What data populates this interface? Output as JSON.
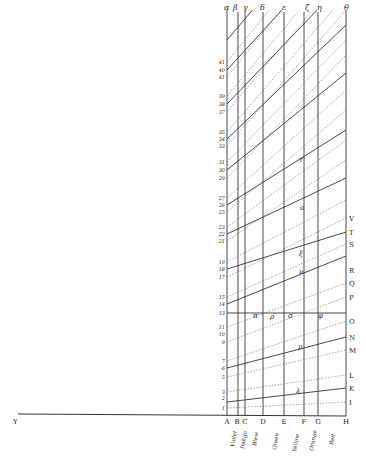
{
  "figure": {
    "baseline_left_label": "Y",
    "baseline_points": [
      {
        "label": "A",
        "x": 227
      },
      {
        "label": "B",
        "x": 238
      },
      {
        "label": "C",
        "x": 245
      },
      {
        "label": "D",
        "x": 263
      },
      {
        "label": "E",
        "x": 284
      },
      {
        "label": "F",
        "x": 304
      },
      {
        "label": "G",
        "x": 318
      },
      {
        "label": "H",
        "x": 346
      }
    ],
    "top_labels": [
      {
        "label": "α",
        "x": 227
      },
      {
        "label": "β",
        "x": 236
      },
      {
        "label": "γ",
        "x": 246
      },
      {
        "label": "δ",
        "x": 263
      },
      {
        "label": "ε",
        "x": 285
      },
      {
        "label": "ζ",
        "x": 308
      },
      {
        "label": "η",
        "x": 320
      },
      {
        "label": "θ",
        "x": 347
      }
    ],
    "color_labels": [
      {
        "label": "Violet",
        "x": 232
      },
      {
        "label": "Indigo",
        "x": 242
      },
      {
        "label": "Blew",
        "x": 255
      },
      {
        "label": "Green",
        "x": 274
      },
      {
        "label": "Yellow",
        "x": 294
      },
      {
        "label": "Orange",
        "x": 311
      },
      {
        "label": "Red",
        "x": 332
      }
    ],
    "left_numbers": [
      {
        "label": "1",
        "y": 408
      },
      {
        "label": "2",
        "y": 398
      },
      {
        "label": "3",
        "y": 392
      },
      {
        "label": "5",
        "y": 377
      },
      {
        "label": "6",
        "y": 368
      },
      {
        "label": "7",
        "y": 361
      },
      {
        "label": "9",
        "y": 342
      },
      {
        "label": "10",
        "y": 334
      },
      {
        "label": "11",
        "y": 327
      },
      {
        "label": "13",
        "y": 313
      },
      {
        "label": "14",
        "y": 304
      },
      {
        "label": "15",
        "y": 297
      },
      {
        "label": "17",
        "y": 277
      },
      {
        "label": "18",
        "y": 269
      },
      {
        "label": "19",
        "y": 262
      },
      {
        "label": "21",
        "y": 241
      },
      {
        "label": "22",
        "y": 234
      },
      {
        "label": "23",
        "y": 227
      },
      {
        "label": "25",
        "y": 212
      },
      {
        "label": "26",
        "y": 205
      },
      {
        "label": "27",
        "y": 198
      },
      {
        "label": "29",
        "y": 178
      },
      {
        "label": "30",
        "y": 170
      },
      {
        "label": "31",
        "y": 162
      },
      {
        "label": "33",
        "y": 146
      },
      {
        "label": "34",
        "y": 139
      },
      {
        "label": "35",
        "y": 132
      },
      {
        "label": "37",
        "y": 112
      },
      {
        "label": "38",
        "y": 104
      },
      {
        "label": "39",
        "y": 96
      },
      {
        "label": "41",
        "y": 77
      },
      {
        "label": "40",
        "y": 70
      },
      {
        "label": "41",
        "y": 62
      }
    ],
    "right_letters": [
      {
        "label": "V",
        "y": 218
      },
      {
        "label": "T",
        "y": 232
      },
      {
        "label": "S",
        "y": 244
      },
      {
        "label": "R",
        "y": 270
      },
      {
        "label": "Q",
        "y": 283
      },
      {
        "label": "P",
        "y": 297
      },
      {
        "label": "O",
        "y": 321
      },
      {
        "label": "N",
        "y": 337
      },
      {
        "label": "M",
        "y": 350
      },
      {
        "label": "L",
        "y": 375
      },
      {
        "label": "K",
        "y": 388
      },
      {
        "label": "I",
        "y": 402
      }
    ],
    "inner_letters": [
      {
        "label": "π",
        "x": 253,
        "y": 316
      },
      {
        "label": "ρ",
        "x": 272,
        "y": 317
      },
      {
        "label": "σ",
        "x": 290,
        "y": 316
      },
      {
        "label": "φ",
        "x": 320,
        "y": 316
      },
      {
        "label": "μ",
        "x": 300,
        "y": 348
      },
      {
        "label": "λ",
        "x": 298,
        "y": 391
      },
      {
        "label": "ν",
        "x": 302,
        "y": 272
      },
      {
        "label": "ξ",
        "x": 302,
        "y": 254
      },
      {
        "label": "ο",
        "x": 303,
        "y": 208
      },
      {
        "label": "τ",
        "x": 302,
        "y": 160
      }
    ],
    "colors": {
      "ink": "#333333",
      "ink_light": "#777777",
      "paper": "#ffffff"
    }
  }
}
